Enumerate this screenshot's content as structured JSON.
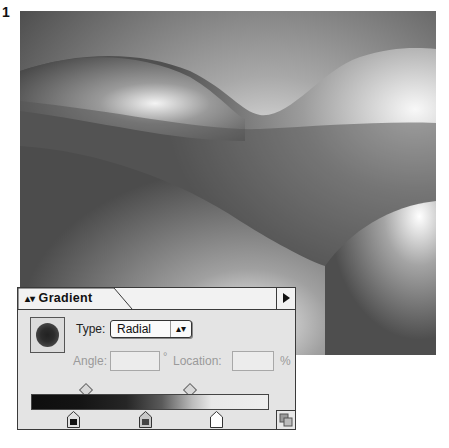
{
  "figure": {
    "number": "1"
  },
  "artwork": {
    "description": "rolling hills filled with radial gradients",
    "colors": {
      "dark": "#4a4a4a",
      "mid": "#8a8a8a",
      "light": "#f4f4f4"
    }
  },
  "panel": {
    "title": "Gradient",
    "title_icon": "updown-arrows-icon",
    "menu_icon": "triangle-right-icon",
    "type": {
      "label": "Type:",
      "value": "Radial",
      "icon": "updown-arrows-icon"
    },
    "angle": {
      "label": "Angle:",
      "value": "",
      "unit": "°"
    },
    "location": {
      "label": "Location:",
      "value": "",
      "unit": "%"
    },
    "gradient_bar": {
      "stops": [
        {
          "position_pct": 17,
          "color": "#111111"
        },
        {
          "position_pct": 48,
          "color": "#444444"
        },
        {
          "position_pct": 78,
          "color": "#ffffff"
        }
      ],
      "midpoints_pct": [
        23,
        66
      ]
    },
    "resize_icon": "grip-icon"
  }
}
